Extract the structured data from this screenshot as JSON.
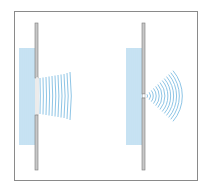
{
  "diagram": {
    "colors": {
      "frame": "#8a8a8a",
      "barrier_fill": "#c8c8c8",
      "barrier_stroke": "#7a7a7a",
      "wave": "#8ec5e6"
    },
    "panels": [
      {
        "id": "wide-slit",
        "description": "Plane waves pass through a wide gap and continue with slight spreading",
        "incident_wave_count": 8,
        "transmitted_wave_count": 12,
        "opening": "wide"
      },
      {
        "id": "narrow-slit",
        "description": "Plane waves pass through a narrow gap and spread out as circular wavefronts",
        "incident_wave_count": 8,
        "diffracted_arc_count": 13,
        "opening": "narrow"
      }
    ]
  }
}
